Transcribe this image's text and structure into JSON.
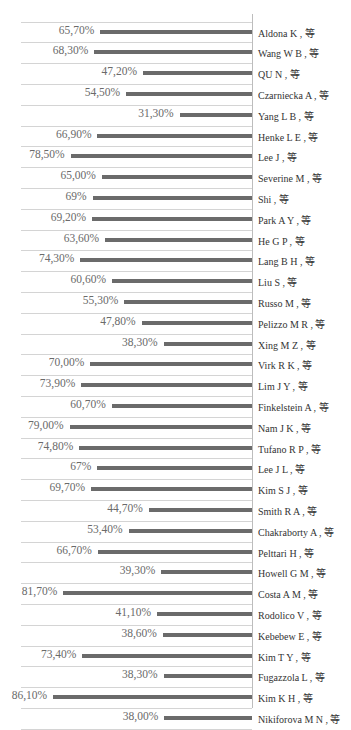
{
  "chart_data": {
    "type": "bar",
    "orientation": "horizontal",
    "title": "",
    "xlabel": "",
    "ylabel": "",
    "xlim": [
      0,
      100
    ],
    "grid": true,
    "legend": null,
    "bar_color": "#6b6b6b",
    "categories": [
      "Aldona K , 等",
      "Wang W B , 等",
      "QU N , 等",
      "Czarniecka A , 等",
      "Yang L B , 等",
      "Henke L E , 等",
      "Lee J , 等",
      "Severine M , 等",
      "Shi , 等",
      "Park A Y , 等",
      "He G P , 等",
      "Lang B H , 等",
      "Liu S , 等",
      "Russo M , 等",
      "Pelizzo M R , 等",
      "Xing M Z , 等",
      "Virk R K , 等",
      "Lim J Y , 等",
      "Finkelstein A , 等",
      "Nam J K , 等",
      "Tufano R P , 等",
      "Lee J L , 等",
      "Kim S J , 等",
      "Smith R A , 等",
      "Chakraborty A , 等",
      "Pelttari H , 等",
      "Howell G M , 等",
      "Costa A M , 等",
      "Rodolico V , 等",
      "Kebebew E , 等",
      "Kim T Y , 等",
      "Fugazzola L , 等",
      "Kim K H , 等",
      "Nikiforova M N , 等"
    ],
    "values": [
      65.7,
      68.3,
      47.2,
      54.5,
      31.3,
      66.9,
      78.5,
      65.0,
      69,
      69.2,
      63.6,
      74.3,
      60.6,
      55.3,
      47.8,
      38.3,
      70.0,
      73.9,
      60.7,
      79.0,
      74.8,
      67,
      69.7,
      44.7,
      53.4,
      66.7,
      39.3,
      81.7,
      41.1,
      38.6,
      73.4,
      38.3,
      86.1,
      38.0
    ],
    "value_labels": [
      "65,70%",
      "68,30%",
      "47,20%",
      "54,50%",
      "31,30%",
      "66,90%",
      "78,50%",
      "65,00%",
      "69%",
      "69,20%",
      "63,60%",
      "74,30%",
      "60,60%",
      "55,30%",
      "47,80%",
      "38,30%",
      "70,00%",
      "73,90%",
      "60,70%",
      "79,00%",
      "74,80%",
      "67%",
      "69,70%",
      "44,70%",
      "53,40%",
      "66,70%",
      "39,30%",
      "81,70%",
      "41,10%",
      "38,60%",
      "73,40%",
      "38,30%",
      "86,10%",
      "38,00%"
    ]
  }
}
